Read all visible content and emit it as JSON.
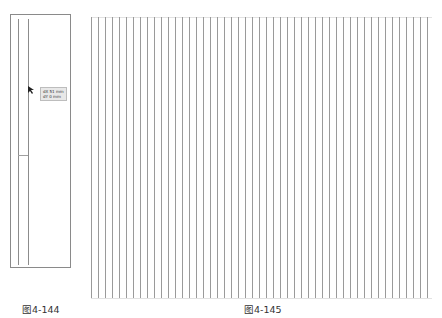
{
  "figures": [
    {
      "id": "left",
      "caption": "图4-144",
      "tooltip": {
        "line1": "dX 51 mm",
        "line2": "dY 0 mm"
      },
      "cursor_icon": "arrow-cursor-icon"
    },
    {
      "id": "right",
      "caption": "图4-145",
      "line_count": 49,
      "line_spacing_px": 7
    }
  ],
  "colors": {
    "line": "#8c8c8c",
    "border": "#8a8a8a",
    "tooltip_bg": "#e8e8e8",
    "caption": "#333333"
  }
}
